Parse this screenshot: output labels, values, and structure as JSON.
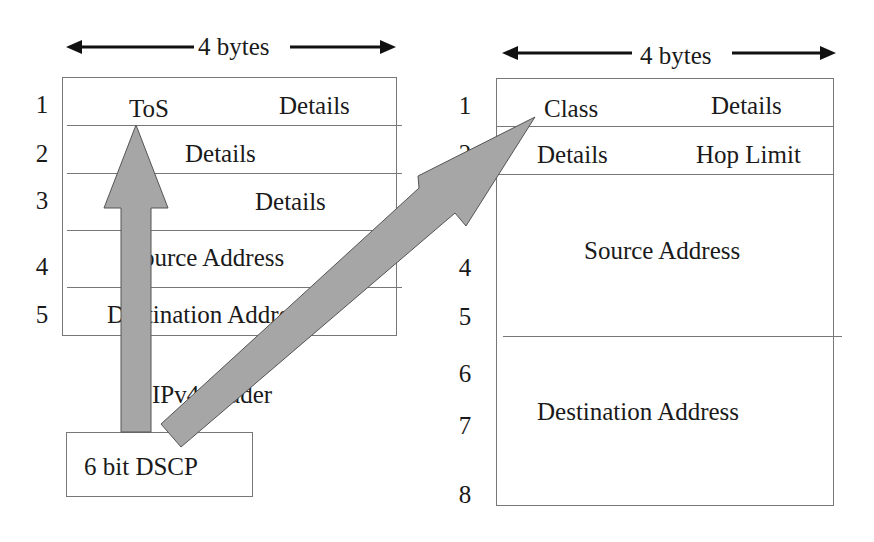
{
  "ipv4": {
    "width_label": "4 bytes",
    "caption": "IPv4 header",
    "row_numbers": [
      "1",
      "2",
      "3",
      "4",
      "5"
    ],
    "rows": [
      {
        "left": "ToS",
        "right": "Details"
      },
      {
        "center": "Details"
      },
      {
        "left": "",
        "right": "Details"
      },
      {
        "center": "Source Address"
      },
      {
        "center": "Destination Address"
      }
    ]
  },
  "ipv6": {
    "width_label": "4 bytes",
    "row_numbers": [
      "1",
      "2",
      "3",
      "4",
      "5",
      "6",
      "7",
      "8"
    ],
    "rows": [
      {
        "left": "Class",
        "right": "Details"
      },
      {
        "left": "Details",
        "right": "Hop Limit"
      },
      {
        "center": "Source Address"
      },
      {
        "center": "Destination Address"
      }
    ]
  },
  "dscp_box": {
    "label": "6 bit DSCP"
  },
  "colors": {
    "arrow_fill": "#a6a6a6",
    "arrow_stroke": "#555555",
    "line": "#777777",
    "text": "#1a1a1a"
  }
}
